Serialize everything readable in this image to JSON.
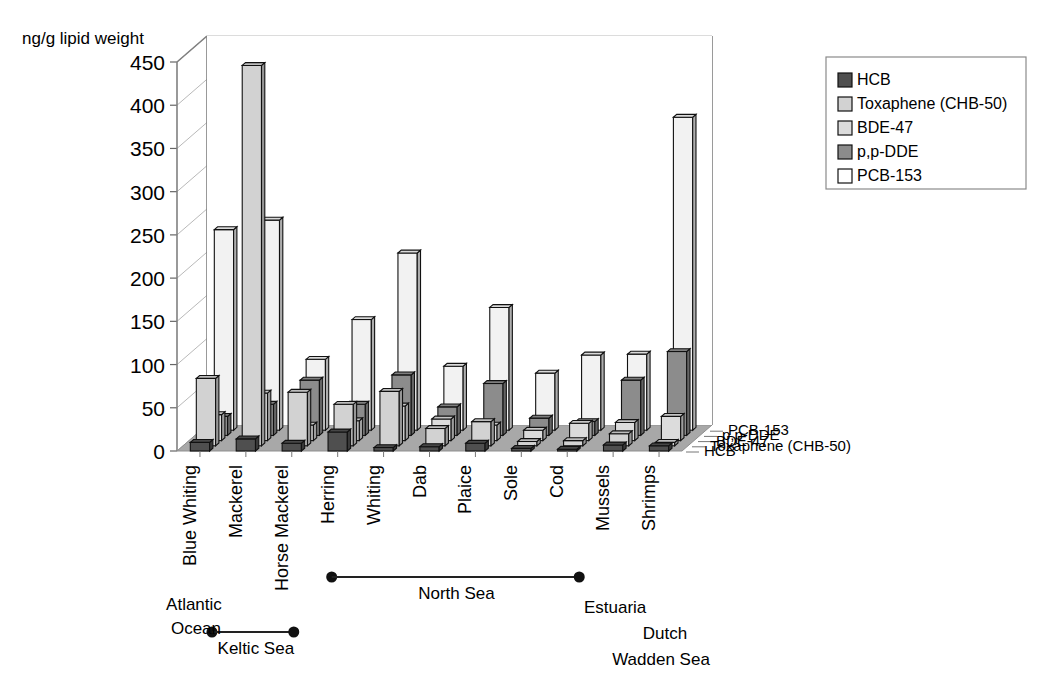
{
  "chart_data": {
    "type": "bar",
    "variant": "3d-grouped-bar",
    "title": "",
    "ylabel": "ng/g lipid weight",
    "xlabel": "",
    "ylim": [
      0,
      450
    ],
    "yticks": [
      0,
      50,
      100,
      150,
      200,
      250,
      300,
      350,
      400,
      450
    ],
    "grid": true,
    "legend_position": "right",
    "categories": [
      "Blue Whiting",
      "Mackerel",
      "Horse Mackerel",
      "Herring",
      "Whiting",
      "Dab",
      "Plaice",
      "Sole",
      "Cod",
      "Mussels",
      "Shrimps"
    ],
    "series": [
      {
        "name": "HCB",
        "color": "#4f4f4f",
        "values": [
          10,
          14,
          9,
          22,
          4,
          5,
          9,
          3,
          2,
          7,
          6
        ]
      },
      {
        "name": "Toxaphene (CHB-50)",
        "color": "#d2d2d2",
        "values": [
          78,
          440,
          62,
          48,
          63,
          20,
          28,
          5,
          6,
          14,
          4
        ]
      },
      {
        "name": "BDE-47",
        "color": "#dcdcdc",
        "values": [
          30,
          55,
          18,
          23,
          40,
          25,
          18,
          12,
          20,
          21,
          28
        ]
      },
      {
        "name": "p,p-DDE",
        "color": "#8c8c8c",
        "values": [
          22,
          36,
          64,
          36,
          70,
          33,
          60,
          20,
          16,
          64,
          97
        ]
      },
      {
        "name": "PCB-153",
        "color": "#f2f2f2",
        "values": [
          232,
          243,
          82,
          128,
          205,
          74,
          142,
          66,
          87,
          88,
          362
        ]
      }
    ],
    "depth_axis_labels": [
      "PCB-153",
      "p,p-DDE",
      "BDE-47",
      "Toxaphene (CHB-50)",
      "HCB"
    ],
    "annotations": [
      {
        "id": "atlantic-ocean",
        "text": "Atlantic\nOcean"
      },
      {
        "id": "keltic-sea",
        "text": "Keltic Sea"
      },
      {
        "id": "north-sea",
        "text": "North Sea"
      },
      {
        "id": "estuaria",
        "text": "Estuaria"
      },
      {
        "id": "dutch-wadden-sea",
        "text": "Dutch\nWadden Sea"
      }
    ]
  },
  "legend": {
    "items": [
      {
        "label": "HCB",
        "color": "#4f4f4f"
      },
      {
        "label": "Toxaphene (CHB-50)",
        "color": "#d2d2d2"
      },
      {
        "label": "BDE-47",
        "color": "#dcdcdc"
      },
      {
        "label": "p,p-DDE",
        "color": "#8c8c8c"
      },
      {
        "label": "PCB-153",
        "color": "#ffffff"
      }
    ]
  },
  "group_labels": {
    "atlantic_line1": "Atlantic",
    "atlantic_line2": "Ocean",
    "keltic": "Keltic Sea",
    "north_sea": "North Sea",
    "estuaria": "Estuaria",
    "dutch_line1": "Dutch",
    "dutch_line2": "Wadden Sea"
  },
  "axis": {
    "y_title": "ng/g lipid weight"
  },
  "colors": {
    "floor": "#a8a8a8",
    "floor_edge": "#8f8f8f",
    "grid": "#bdbdbd",
    "axis": "#808080"
  }
}
